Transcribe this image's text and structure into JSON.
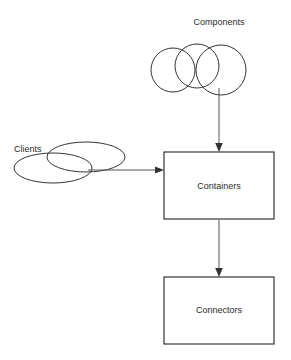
{
  "diagram": {
    "canvas": {
      "width": 291,
      "height": 360,
      "background": "#ffffff"
    },
    "colors": {
      "outline": "#343434",
      "box_outline": "#343434",
      "box_fill": "#ffffff",
      "connector": "#555555",
      "arrow_head": "#333333",
      "text": "#2b2b2b"
    },
    "labels": {
      "components": "Components",
      "clients": "Clients",
      "containers": "Containers",
      "connectors": "Connectors"
    },
    "nodes": [
      {
        "name": "components",
        "label": "Components",
        "shape": "three-overlapping-circles",
        "label_position": {
          "x": 219,
          "y": 25,
          "anchor": "middle"
        },
        "circles": [
          {
            "cx": 173,
            "cy": 70,
            "r": 22
          },
          {
            "cx": 197,
            "cy": 66,
            "r": 22
          },
          {
            "cx": 221,
            "cy": 70,
            "r": 25
          }
        ]
      },
      {
        "name": "clients",
        "label": "Clients",
        "shape": "two-overlapping-ellipses",
        "label_position": {
          "x": 14,
          "y": 152,
          "anchor": "start"
        },
        "ellipses": [
          {
            "cx": 86,
            "cy": 157,
            "rx": 39,
            "ry": 15
          },
          {
            "cx": 53,
            "cy": 168,
            "rx": 39,
            "ry": 15
          }
        ]
      },
      {
        "name": "containers",
        "label": "Containers",
        "shape": "rectangle",
        "rect": {
          "x": 164,
          "y": 152,
          "width": 110,
          "height": 67
        },
        "label_position": {
          "x": 219,
          "y": 189,
          "anchor": "middle"
        }
      },
      {
        "name": "connectors",
        "label": "Connectors",
        "shape": "rectangle",
        "rect": {
          "x": 164,
          "y": 277,
          "width": 110,
          "height": 67
        },
        "label_position": {
          "x": 219,
          "y": 313,
          "anchor": "middle"
        }
      }
    ],
    "edges": [
      {
        "name": "components-to-containers",
        "from": "components",
        "to": "containers",
        "direction": "down",
        "x1": 219,
        "y1": 88,
        "x2": 219,
        "y2": 151,
        "arrow_at": "end"
      },
      {
        "name": "clients-to-containers",
        "from": "clients",
        "to": "containers",
        "direction": "right",
        "x1": 88,
        "y1": 170,
        "x2": 163,
        "y2": 170,
        "arrow_at": "end"
      },
      {
        "name": "containers-to-connectors",
        "from": "containers",
        "to": "connectors",
        "direction": "down",
        "x1": 219,
        "y1": 220,
        "x2": 219,
        "y2": 276,
        "arrow_at": "end"
      }
    ]
  }
}
